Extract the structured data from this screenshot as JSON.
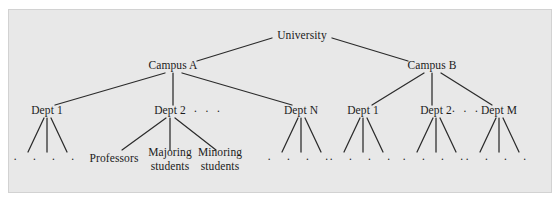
{
  "figure": {
    "background_color": "#ffffff",
    "panel_color": "#e8e8e8",
    "panel_border_color": "#d2d2d2",
    "line_color": "#2b2b2b",
    "text_color": "#1b1b1b"
  },
  "tree": {
    "root": {
      "label": "University",
      "x": 302,
      "y": 36
    },
    "level2": [
      {
        "label": "Campus A",
        "x": 173,
        "y": 66
      },
      {
        "label": "Campus B",
        "x": 432,
        "y": 66
      }
    ],
    "level3": [
      {
        "label": "Dept 1",
        "x": 47,
        "y": 111
      },
      {
        "label": "Dept 2",
        "x": 170,
        "y": 111
      },
      {
        "label": "Dept N",
        "x": 301,
        "y": 111
      },
      {
        "label": "Dept 1",
        "x": 363,
        "y": 111
      },
      {
        "label": "Dept 2",
        "x": 436,
        "y": 111
      },
      {
        "label": "Dept M",
        "x": 499,
        "y": 111
      }
    ],
    "level3_ellipses": [
      {
        "label": "· · ·",
        "x": 208,
        "y": 111
      },
      {
        "label": "· · ·",
        "x": 466,
        "y": 111
      }
    ],
    "leaves_named": [
      {
        "label_line1": "Professors",
        "label_line2": "",
        "x": 114,
        "y": 159
      },
      {
        "label_line1": "Majoring",
        "label_line2": "students",
        "x": 170,
        "y": 159
      },
      {
        "label_line1": "Minoring",
        "label_line2": "students",
        "x": 220,
        "y": 159
      }
    ],
    "leaf_dot_groups": [
      {
        "dots": "· · · ·",
        "x": 47,
        "y": 159
      },
      {
        "dots": "· · · ·",
        "x": 301,
        "y": 159
      },
      {
        "dots": "· · · ·",
        "x": 363,
        "y": 159
      },
      {
        "dots": "· · · ·",
        "x": 436,
        "y": 159
      },
      {
        "dots": "· · · ·",
        "x": 499,
        "y": 159
      }
    ],
    "edges": [
      {
        "from": "University",
        "to": "Campus A",
        "x1": 272,
        "y1": 38,
        "x2": 197,
        "y2": 61
      },
      {
        "from": "University",
        "to": "Campus B",
        "x1": 332,
        "y1": 38,
        "x2": 408,
        "y2": 61
      },
      {
        "from": "Campus A",
        "to": "Dept 1",
        "x1": 165,
        "y1": 73,
        "x2": 55,
        "y2": 105
      },
      {
        "from": "Campus A",
        "to": "Dept 2",
        "x1": 173,
        "y1": 73,
        "x2": 173,
        "y2": 105
      },
      {
        "from": "Campus A",
        "to": "Dept N",
        "x1": 182,
        "y1": 73,
        "x2": 292,
        "y2": 105
      },
      {
        "from": "Campus B",
        "to": "Dept 1",
        "x1": 424,
        "y1": 73,
        "x2": 372,
        "y2": 105
      },
      {
        "from": "Campus B",
        "to": "Dept 2",
        "x1": 432,
        "y1": 73,
        "x2": 432,
        "y2": 105
      },
      {
        "from": "Campus B",
        "to": "Dept M",
        "x1": 441,
        "y1": 73,
        "x2": 492,
        "y2": 105
      },
      {
        "from": "Dept 1 (A)",
        "to": "leaf",
        "x1": 44,
        "y1": 118,
        "x2": 28,
        "y2": 152
      },
      {
        "from": "Dept 1 (A)",
        "to": "leaf",
        "x1": 47,
        "y1": 118,
        "x2": 47,
        "y2": 152
      },
      {
        "from": "Dept 1 (A)",
        "to": "leaf",
        "x1": 51,
        "y1": 118,
        "x2": 67,
        "y2": 152
      },
      {
        "from": "Dept 2 (A)",
        "to": "Professors",
        "x1": 166,
        "y1": 118,
        "x2": 122,
        "y2": 150
      },
      {
        "from": "Dept 2 (A)",
        "to": "Majoring students",
        "x1": 170,
        "y1": 118,
        "x2": 170,
        "y2": 150
      },
      {
        "from": "Dept 2 (A)",
        "to": "Minoring students",
        "x1": 175,
        "y1": 118,
        "x2": 216,
        "y2": 150
      },
      {
        "from": "Dept N (A)",
        "to": "leaf",
        "x1": 298,
        "y1": 118,
        "x2": 282,
        "y2": 152
      },
      {
        "from": "Dept N (A)",
        "to": "leaf",
        "x1": 301,
        "y1": 118,
        "x2": 301,
        "y2": 152
      },
      {
        "from": "Dept N (A)",
        "to": "leaf",
        "x1": 305,
        "y1": 118,
        "x2": 321,
        "y2": 152
      },
      {
        "from": "Dept 1 (B)",
        "to": "leaf",
        "x1": 360,
        "y1": 118,
        "x2": 344,
        "y2": 152
      },
      {
        "from": "Dept 1 (B)",
        "to": "leaf",
        "x1": 363,
        "y1": 118,
        "x2": 363,
        "y2": 152
      },
      {
        "from": "Dept 1 (B)",
        "to": "leaf",
        "x1": 367,
        "y1": 118,
        "x2": 383,
        "y2": 152
      },
      {
        "from": "Dept 2 (B)",
        "to": "leaf",
        "x1": 433,
        "y1": 118,
        "x2": 417,
        "y2": 152
      },
      {
        "from": "Dept 2 (B)",
        "to": "leaf",
        "x1": 436,
        "y1": 118,
        "x2": 436,
        "y2": 152
      },
      {
        "from": "Dept 2 (B)",
        "to": "leaf",
        "x1": 440,
        "y1": 118,
        "x2": 456,
        "y2": 152
      },
      {
        "from": "Dept M (B)",
        "to": "leaf",
        "x1": 496,
        "y1": 118,
        "x2": 480,
        "y2": 152
      },
      {
        "from": "Dept M (B)",
        "to": "leaf",
        "x1": 499,
        "y1": 118,
        "x2": 499,
        "y2": 152
      },
      {
        "from": "Dept M (B)",
        "to": "leaf",
        "x1": 503,
        "y1": 118,
        "x2": 519,
        "y2": 152
      }
    ]
  }
}
